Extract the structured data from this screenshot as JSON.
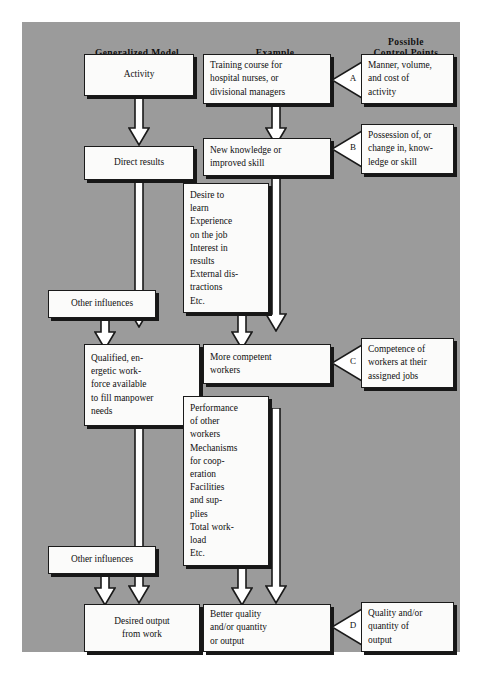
{
  "figure": {
    "background_color": "#9b9b9b",
    "box_fill": "#fbfbfa",
    "ink": "#1a1a1a"
  },
  "headers": {
    "left": "Generalized Model",
    "middle": "Example",
    "right_line1": "Possible",
    "right_line2": "Control Points"
  },
  "generalized_model": {
    "activity": "Activity",
    "direct_results": "Direct results",
    "other_influences_1": "Other influences",
    "workforce": [
      "Qualified, en-",
      "ergetic work-",
      "force available",
      "to fill manpower",
      "needs"
    ],
    "other_influences_2": "Other influences",
    "desired_output": [
      "Desired  output",
      "from work"
    ]
  },
  "example": {
    "training": [
      "Training course for",
      "hospital nurses, or",
      "divisional managers"
    ],
    "new_knowledge": [
      "New knowledge or",
      "improved skill"
    ],
    "factors_1": [
      "Desire to",
      "learn",
      "Experience",
      "on the job",
      "Interest in",
      "results",
      "External dis-",
      "tractions",
      "Etc."
    ],
    "more_competent": [
      "More competent",
      "workers"
    ],
    "factors_2": [
      "Performance",
      "of other",
      "workers",
      "Mechanisms",
      "for coop-",
      "eration",
      "Facilities",
      "and sup-",
      "plies",
      "Total work-",
      "load",
      "Etc."
    ],
    "better_quality": [
      "Better quality",
      "and/or quantity",
      "or output"
    ]
  },
  "control_points": {
    "a": {
      "letter": "A",
      "lines": [
        "Manner, volume,",
        "and cost of",
        "activity"
      ]
    },
    "b": {
      "letter": "B",
      "lines": [
        "Possession of, or",
        "change in, know-",
        "ledge or skill"
      ]
    },
    "c": {
      "letter": "C",
      "lines": [
        "Competence of",
        "workers at their",
        "assigned jobs"
      ]
    },
    "d": {
      "letter": "D",
      "lines": [
        "Quality and/or",
        "quantity of",
        "output"
      ]
    }
  }
}
